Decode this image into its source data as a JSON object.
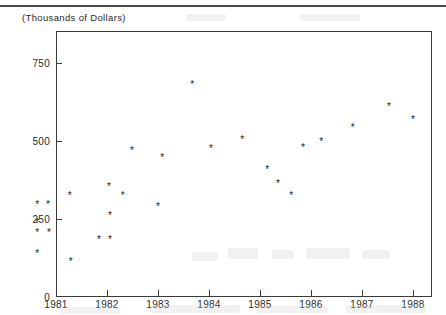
{
  "figure": {
    "axis_caption": "(Thousands of Dollars)",
    "frame_color": "#3a3a3a",
    "marker_glyph": "*",
    "marker_color": "#1d1d1d",
    "background_color": "#ffffff"
  },
  "chart_data": {
    "type": "scatter",
    "title": "",
    "subtitle": "",
    "xlabel": "",
    "ylabel": "(Thousands of Dollars)",
    "xlim": [
      1980.6,
      1988.4
    ],
    "ylim": [
      0,
      852
    ],
    "grid": false,
    "legend": null,
    "legend_position": "none",
    "xticks": [
      1981,
      1982,
      1983,
      1984,
      1985,
      1986,
      1987,
      1988
    ],
    "xticklabels": [
      "1981",
      "1982",
      "1983",
      "1984",
      "1985",
      "1986",
      "1987",
      "1988"
    ],
    "yticks": [
      0,
      250,
      500,
      750
    ],
    "yticklabels": [
      "0",
      "250",
      "500",
      "750"
    ],
    "marker": "asterisk",
    "points": [
      {
        "x": 1980.63,
        "y": 295
      },
      {
        "x": 1980.84,
        "y": 295
      },
      {
        "x": 1980.63,
        "y": 240
      },
      {
        "x": 1980.63,
        "y": 208
      },
      {
        "x": 1980.86,
        "y": 208
      },
      {
        "x": 1980.63,
        "y": 141
      },
      {
        "x": 1981.27,
        "y": 325
      },
      {
        "x": 1981.29,
        "y": 115
      },
      {
        "x": 1981.84,
        "y": 185
      },
      {
        "x": 1982.06,
        "y": 185
      },
      {
        "x": 1982.06,
        "y": 260
      },
      {
        "x": 1982.04,
        "y": 355
      },
      {
        "x": 1982.31,
        "y": 325
      },
      {
        "x": 1982.49,
        "y": 470
      },
      {
        "x": 1983.0,
        "y": 290
      },
      {
        "x": 1983.08,
        "y": 448
      },
      {
        "x": 1983.67,
        "y": 682
      },
      {
        "x": 1984.04,
        "y": 475
      },
      {
        "x": 1984.65,
        "y": 505
      },
      {
        "x": 1985.14,
        "y": 410
      },
      {
        "x": 1985.35,
        "y": 365
      },
      {
        "x": 1985.61,
        "y": 325
      },
      {
        "x": 1985.84,
        "y": 478
      },
      {
        "x": 1986.2,
        "y": 498
      },
      {
        "x": 1986.82,
        "y": 543
      },
      {
        "x": 1987.53,
        "y": 612
      },
      {
        "x": 1988.0,
        "y": 570
      }
    ]
  },
  "smudges": [
    {
      "left": 192,
      "top": 252,
      "width": 26,
      "height": 9
    },
    {
      "left": 228,
      "top": 248,
      "width": 30,
      "height": 11
    },
    {
      "left": 272,
      "top": 250,
      "width": 22,
      "height": 9
    },
    {
      "left": 306,
      "top": 248,
      "width": 44,
      "height": 11
    },
    {
      "left": 362,
      "top": 250,
      "width": 28,
      "height": 9
    },
    {
      "left": 60,
      "top": 307,
      "width": 60,
      "height": 7
    },
    {
      "left": 150,
      "top": 305,
      "width": 90,
      "height": 8
    },
    {
      "left": 258,
      "top": 306,
      "width": 70,
      "height": 7
    },
    {
      "left": 346,
      "top": 305,
      "width": 80,
      "height": 8
    },
    {
      "left": 186,
      "top": 14,
      "width": 40,
      "height": 7
    },
    {
      "left": 300,
      "top": 14,
      "width": 60,
      "height": 7
    }
  ]
}
